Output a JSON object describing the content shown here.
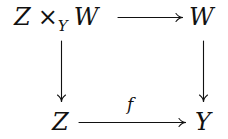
{
  "diagram": {
    "type": "commutative-square",
    "nodes": {
      "top_left": {
        "base": "Z",
        "op": "×",
        "sub": "Y",
        "right": "W"
      },
      "top_right": "W",
      "bottom_left": "Z",
      "bottom_right": "Y"
    },
    "arrows": [
      {
        "from": "top_left",
        "to": "top_right",
        "label": ""
      },
      {
        "from": "top_left",
        "to": "bottom_left",
        "label": ""
      },
      {
        "from": "top_right",
        "to": "bottom_right",
        "label": ""
      },
      {
        "from": "bottom_left",
        "to": "bottom_right",
        "label": "f"
      }
    ],
    "labels": {
      "bottom_arrow": "f"
    }
  }
}
